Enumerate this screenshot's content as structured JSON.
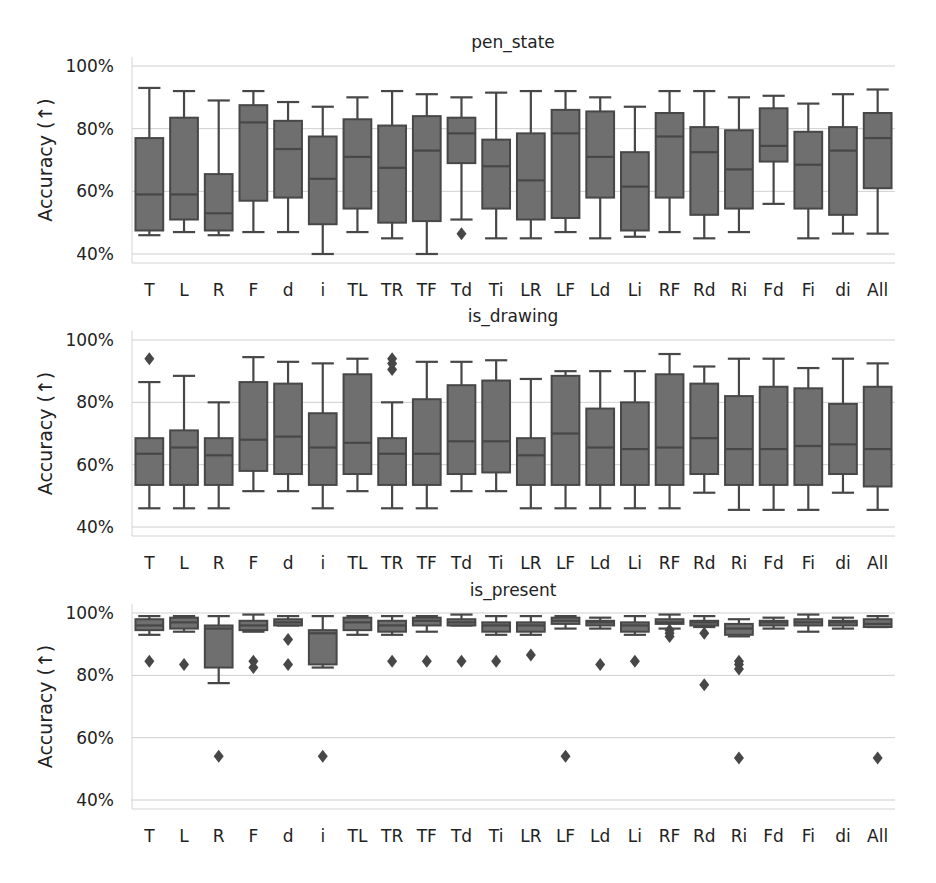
{
  "figure": {
    "ylabel": "Accuracy (→)",
    "ylabel_display": "Accuracy (↑)",
    "yticks": [
      "40%",
      "60%",
      "80%",
      "100%"
    ],
    "colors": {
      "box_fill": "#6f6f6f",
      "box_edge": "#474747",
      "grid": "#cfcfcf",
      "axis": "#d4d4d4",
      "text": "#222222"
    }
  },
  "chart_data": [
    {
      "type": "box",
      "title": "pen_state",
      "xlabel": "",
      "ylabel": "Accuracy (↑)",
      "ylim": [
        40,
        100
      ],
      "yticks": [
        40,
        60,
        80,
        100
      ],
      "grid": true,
      "categories": [
        "T",
        "L",
        "R",
        "F",
        "d",
        "i",
        "TL",
        "TR",
        "TF",
        "Td",
        "Ti",
        "LR",
        "LF",
        "Ld",
        "Li",
        "RF",
        "Rd",
        "Ri",
        "Fd",
        "Fi",
        "di",
        "All"
      ],
      "boxes": [
        {
          "whislo": 46,
          "q1": 47.5,
          "med": 59,
          "q3": 77,
          "whishi": 93,
          "fliers": []
        },
        {
          "whislo": 47,
          "q1": 51,
          "med": 59,
          "q3": 83.5,
          "whishi": 92,
          "fliers": []
        },
        {
          "whislo": 46,
          "q1": 47.5,
          "med": 53,
          "q3": 65.5,
          "whishi": 89,
          "fliers": []
        },
        {
          "whislo": 47,
          "q1": 57,
          "med": 82,
          "q3": 87.5,
          "whishi": 92,
          "fliers": []
        },
        {
          "whislo": 47,
          "q1": 58,
          "med": 73.5,
          "q3": 82.5,
          "whishi": 88.5,
          "fliers": []
        },
        {
          "whislo": 40,
          "q1": 49.5,
          "med": 64,
          "q3": 77.5,
          "whishi": 87,
          "fliers": []
        },
        {
          "whislo": 47,
          "q1": 54.5,
          "med": 71,
          "q3": 83,
          "whishi": 90,
          "fliers": []
        },
        {
          "whislo": 45,
          "q1": 50,
          "med": 67.5,
          "q3": 81,
          "whishi": 92,
          "fliers": []
        },
        {
          "whislo": 40,
          "q1": 50.5,
          "med": 73,
          "q3": 84,
          "whishi": 91,
          "fliers": []
        },
        {
          "whislo": 51,
          "q1": 69,
          "med": 78.5,
          "q3": 83.5,
          "whishi": 90,
          "fliers": [
            46.5
          ]
        },
        {
          "whislo": 45,
          "q1": 54.5,
          "med": 68,
          "q3": 76.5,
          "whishi": 91.5,
          "fliers": []
        },
        {
          "whislo": 45,
          "q1": 51,
          "med": 63.5,
          "q3": 78.5,
          "whishi": 92,
          "fliers": []
        },
        {
          "whislo": 47,
          "q1": 51.5,
          "med": 78.5,
          "q3": 86,
          "whishi": 92,
          "fliers": []
        },
        {
          "whislo": 45,
          "q1": 58,
          "med": 71,
          "q3": 85.5,
          "whishi": 90,
          "fliers": []
        },
        {
          "whislo": 45.5,
          "q1": 47.5,
          "med": 61.5,
          "q3": 72.5,
          "whishi": 87,
          "fliers": []
        },
        {
          "whislo": 47,
          "q1": 58,
          "med": 77.5,
          "q3": 85,
          "whishi": 92,
          "fliers": []
        },
        {
          "whislo": 45,
          "q1": 52.5,
          "med": 72.5,
          "q3": 80.5,
          "whishi": 92,
          "fliers": []
        },
        {
          "whislo": 47,
          "q1": 54.5,
          "med": 67,
          "q3": 79.5,
          "whishi": 90,
          "fliers": []
        },
        {
          "whislo": 56,
          "q1": 69.5,
          "med": 74.5,
          "q3": 86.5,
          "whishi": 90.5,
          "fliers": []
        },
        {
          "whislo": 45,
          "q1": 54.5,
          "med": 68.5,
          "q3": 79,
          "whishi": 88,
          "fliers": []
        },
        {
          "whislo": 46.5,
          "q1": 52.5,
          "med": 73,
          "q3": 80.5,
          "whishi": 91,
          "fliers": []
        },
        {
          "whislo": 46.5,
          "q1": 61,
          "med": 77,
          "q3": 85,
          "whishi": 92.5,
          "fliers": []
        }
      ]
    },
    {
      "type": "box",
      "title": "is_drawing",
      "xlabel": "",
      "ylabel": "Accuracy (↑)",
      "ylim": [
        40,
        100
      ],
      "yticks": [
        40,
        60,
        80,
        100
      ],
      "grid": true,
      "categories": [
        "T",
        "L",
        "R",
        "F",
        "d",
        "i",
        "TL",
        "TR",
        "TF",
        "Td",
        "Ti",
        "LR",
        "LF",
        "Ld",
        "Li",
        "RF",
        "Rd",
        "Ri",
        "Fd",
        "Fi",
        "di",
        "All"
      ],
      "boxes": [
        {
          "whislo": 46,
          "q1": 53.5,
          "med": 63.5,
          "q3": 68.5,
          "whishi": 86.5,
          "fliers": [
            94
          ]
        },
        {
          "whislo": 46,
          "q1": 53.5,
          "med": 65.5,
          "q3": 71,
          "whishi": 88.5,
          "fliers": []
        },
        {
          "whislo": 46,
          "q1": 53.5,
          "med": 63,
          "q3": 68.5,
          "whishi": 80,
          "fliers": []
        },
        {
          "whislo": 51.5,
          "q1": 58,
          "med": 68,
          "q3": 86.5,
          "whishi": 94.5,
          "fliers": []
        },
        {
          "whislo": 51.5,
          "q1": 57,
          "med": 69,
          "q3": 86,
          "whishi": 93,
          "fliers": []
        },
        {
          "whislo": 46,
          "q1": 53.5,
          "med": 65.5,
          "q3": 76.5,
          "whishi": 92.5,
          "fliers": []
        },
        {
          "whislo": 51.5,
          "q1": 57,
          "med": 67,
          "q3": 89,
          "whishi": 94,
          "fliers": []
        },
        {
          "whislo": 46,
          "q1": 53.5,
          "med": 63.5,
          "q3": 68.5,
          "whishi": 80,
          "fliers": [
            90.5,
            92.5,
            94
          ]
        },
        {
          "whislo": 46,
          "q1": 53.5,
          "med": 63.5,
          "q3": 81,
          "whishi": 93,
          "fliers": []
        },
        {
          "whislo": 51.5,
          "q1": 57,
          "med": 67.5,
          "q3": 85.5,
          "whishi": 93,
          "fliers": []
        },
        {
          "whislo": 51.5,
          "q1": 57.5,
          "med": 67.5,
          "q3": 87,
          "whishi": 93.5,
          "fliers": []
        },
        {
          "whislo": 46,
          "q1": 53.5,
          "med": 63,
          "q3": 68.5,
          "whishi": 87.5,
          "fliers": []
        },
        {
          "whislo": 46,
          "q1": 53.5,
          "med": 70,
          "q3": 88.5,
          "whishi": 90,
          "fliers": []
        },
        {
          "whislo": 46,
          "q1": 53.5,
          "med": 65.5,
          "q3": 78,
          "whishi": 90,
          "fliers": []
        },
        {
          "whislo": 46,
          "q1": 53.5,
          "med": 65,
          "q3": 80,
          "whishi": 90,
          "fliers": []
        },
        {
          "whislo": 46,
          "q1": 53.5,
          "med": 65.5,
          "q3": 89,
          "whishi": 95.5,
          "fliers": []
        },
        {
          "whislo": 51,
          "q1": 57,
          "med": 68.5,
          "q3": 86,
          "whishi": 91.5,
          "fliers": []
        },
        {
          "whislo": 45.5,
          "q1": 53.5,
          "med": 65,
          "q3": 82,
          "whishi": 94,
          "fliers": []
        },
        {
          "whislo": 45.5,
          "q1": 53.5,
          "med": 65,
          "q3": 85,
          "whishi": 94,
          "fliers": []
        },
        {
          "whislo": 45.5,
          "q1": 53.5,
          "med": 66,
          "q3": 84.5,
          "whishi": 91,
          "fliers": []
        },
        {
          "whislo": 51,
          "q1": 57,
          "med": 66.5,
          "q3": 79.5,
          "whishi": 94,
          "fliers": []
        },
        {
          "whislo": 45.5,
          "q1": 53,
          "med": 65,
          "q3": 85,
          "whishi": 92.5,
          "fliers": []
        }
      ]
    },
    {
      "type": "box",
      "title": "is_present",
      "xlabel": "",
      "ylabel": "Accuracy (↑)",
      "ylim": [
        40,
        100
      ],
      "yticks": [
        40,
        60,
        80,
        100
      ],
      "grid": true,
      "categories": [
        "T",
        "L",
        "R",
        "F",
        "d",
        "i",
        "TL",
        "TR",
        "TF",
        "Td",
        "Ti",
        "LR",
        "LF",
        "Ld",
        "Li",
        "RF",
        "Rd",
        "Ri",
        "Fd",
        "Fi",
        "di",
        "All"
      ],
      "boxes": [
        {
          "whislo": 93,
          "q1": 94.5,
          "med": 96,
          "q3": 98,
          "whishi": 99,
          "fliers": [
            84.5
          ]
        },
        {
          "whislo": 94,
          "q1": 95,
          "med": 97,
          "q3": 98.5,
          "whishi": 99,
          "fliers": [
            83.5
          ]
        },
        {
          "whislo": 77.5,
          "q1": 82.5,
          "med": 95,
          "q3": 96,
          "whishi": 99,
          "fliers": [
            54
          ]
        },
        {
          "whislo": 94,
          "q1": 94.5,
          "med": 96,
          "q3": 97.5,
          "whishi": 99.5,
          "fliers": [
            82.5,
            84.5
          ]
        },
        {
          "whislo": 96,
          "q1": 96,
          "med": 97,
          "q3": 98,
          "whishi": 99,
          "fliers": [
            83.5,
            91.5
          ]
        },
        {
          "whislo": 82.5,
          "q1": 83.5,
          "med": 93.5,
          "q3": 94.5,
          "whishi": 99,
          "fliers": [
            54
          ]
        },
        {
          "whislo": 93,
          "q1": 94.5,
          "med": 97,
          "q3": 98.5,
          "whishi": 99,
          "fliers": []
        },
        {
          "whislo": 93,
          "q1": 94,
          "med": 96,
          "q3": 97.5,
          "whishi": 99,
          "fliers": [
            84.5
          ]
        },
        {
          "whislo": 94,
          "q1": 96,
          "med": 97.5,
          "q3": 98.5,
          "whishi": 99,
          "fliers": [
            84.5
          ]
        },
        {
          "whislo": 96,
          "q1": 96,
          "med": 97,
          "q3": 98,
          "whishi": 99.5,
          "fliers": [
            84.5
          ]
        },
        {
          "whislo": 93,
          "q1": 94,
          "med": 96,
          "q3": 97,
          "whishi": 99,
          "fliers": [
            84.5
          ]
        },
        {
          "whislo": 93,
          "q1": 94,
          "med": 96,
          "q3": 97,
          "whishi": 99,
          "fliers": [
            86.5
          ]
        },
        {
          "whislo": 95,
          "q1": 96.5,
          "med": 97.5,
          "q3": 98.5,
          "whishi": 99,
          "fliers": [
            54
          ]
        },
        {
          "whislo": 95,
          "q1": 96,
          "med": 97,
          "q3": 97.5,
          "whishi": 98.5,
          "fliers": [
            83.5
          ]
        },
        {
          "whislo": 93,
          "q1": 94,
          "med": 96,
          "q3": 97,
          "whishi": 99,
          "fliers": [
            84.5
          ]
        },
        {
          "whislo": 95,
          "q1": 96.5,
          "med": 97,
          "q3": 98,
          "whishi": 99.5,
          "fliers": [
            92.5,
            93.5,
            94.5
          ]
        },
        {
          "whislo": 95.5,
          "q1": 96,
          "med": 97,
          "q3": 97.5,
          "whishi": 99,
          "fliers": [
            93.5,
            77
          ]
        },
        {
          "whislo": 92.5,
          "q1": 93,
          "med": 95,
          "q3": 96.5,
          "whishi": 98,
          "fliers": [
            82,
            83.5,
            84.5,
            53.5
          ]
        },
        {
          "whislo": 95,
          "q1": 96,
          "med": 97,
          "q3": 97.5,
          "whishi": 98.5,
          "fliers": []
        },
        {
          "whislo": 94,
          "q1": 96,
          "med": 97,
          "q3": 98,
          "whishi": 99.5,
          "fliers": []
        },
        {
          "whislo": 95,
          "q1": 96,
          "med": 97,
          "q3": 97.5,
          "whishi": 98.5,
          "fliers": []
        },
        {
          "whislo": 95.5,
          "q1": 95.5,
          "med": 96.5,
          "q3": 98,
          "whishi": 99,
          "fliers": [
            53.5
          ]
        }
      ]
    }
  ],
  "panels": [
    {
      "title": "pen_state",
      "y100": 66,
      "y40": 254,
      "axis_bottom": 263,
      "axis_top": 57,
      "title_y": 48
    },
    {
      "title": "is_drawing",
      "y100": 340,
      "y40": 527,
      "axis_bottom": 536,
      "axis_top": 331,
      "title_y": 322
    },
    {
      "title": "is_present",
      "y100": 613,
      "y40": 800,
      "axis_bottom": 809,
      "axis_top": 604,
      "title_y": 596
    }
  ]
}
